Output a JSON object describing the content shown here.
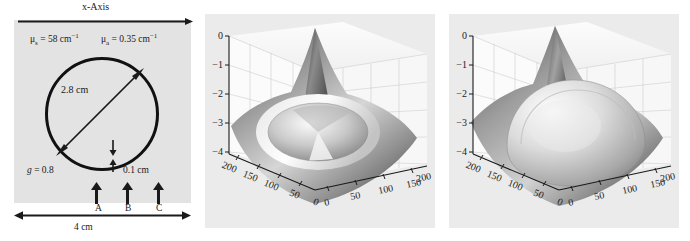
{
  "figure": {
    "panels": [
      "geometry-diagram",
      "surface-plot-crater",
      "surface-plot-dome"
    ]
  },
  "diagram": {
    "axis_title": "x-Axis",
    "mu_s": {
      "symbol": "μ",
      "sub": "s",
      "eq": " = 58 cm",
      "sup": "−1"
    },
    "mu_a": {
      "symbol": "μ",
      "sub": "a",
      "eq": " = 0.35 cm",
      "sup": "−1"
    },
    "anisotropy": {
      "symbol": "g",
      "value": " = 0.8"
    },
    "diameter_label": "2.8 cm",
    "gap_label": "0.1 cm",
    "width_label": "4 cm",
    "source_labels": [
      "A",
      "B",
      "C"
    ],
    "circle_outline_color": "#111111",
    "panel_background": "#e3e3e3"
  },
  "chart_data": [
    {
      "type": "surface",
      "title": "",
      "xlabel": "",
      "ylabel": "",
      "zlabel": "",
      "xticks": [
        0,
        50,
        100,
        150,
        200
      ],
      "yticks": [
        0,
        50,
        100,
        150,
        200
      ],
      "zticks": [
        0,
        -1,
        -2,
        -3,
        -4
      ],
      "xlim": [
        0,
        220
      ],
      "ylim": [
        0,
        220
      ],
      "zlim": [
        -4,
        0
      ],
      "grid": true,
      "legend": "none",
      "description": "log-fluence surface with central crater/depression and sharp corner spike",
      "features": {
        "center_shape": "crater",
        "peak_corner_z": 0.3,
        "rim_z": -1.6,
        "crater_floor_z": -2.6,
        "corner_min_z": -4.0
      }
    },
    {
      "type": "surface",
      "title": "",
      "xlabel": "",
      "ylabel": "",
      "zlabel": "",
      "xticks": [
        0,
        50,
        100,
        150,
        200
      ],
      "yticks": [
        0,
        50,
        100,
        150,
        200
      ],
      "zticks": [
        0,
        -1,
        -2,
        -3,
        -4
      ],
      "xlim": [
        0,
        220
      ],
      "ylim": [
        0,
        220
      ],
      "zlim": [
        -4,
        0
      ],
      "grid": true,
      "legend": "none",
      "description": "log-fluence surface with broad raised central dome and sharp corner spike",
      "features": {
        "center_shape": "dome",
        "peak_corner_z": 0.45,
        "dome_top_z": -1.2,
        "dome_edge_z": -2.3,
        "corner_min_z": -4.0
      }
    }
  ]
}
